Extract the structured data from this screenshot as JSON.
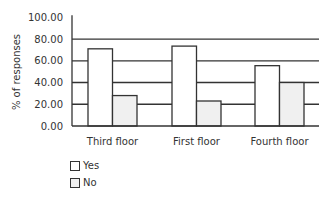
{
  "chart_data": {
    "type": "bar",
    "title": "",
    "xlabel": "",
    "ylabel": "% of responses",
    "ylim": [
      0,
      100
    ],
    "yticks": [
      "0.00",
      "20.00",
      "40.00",
      "60.00",
      "80.00",
      "100.00"
    ],
    "grid": true,
    "legend_position": "bottom-left",
    "categories": [
      "Third floor",
      "First floor",
      "Fourth floor"
    ],
    "series": [
      {
        "name": "Yes",
        "color": "#ffffff",
        "values": [
          71,
          73.5,
          55.5
        ]
      },
      {
        "name": "No",
        "color": "#f0f0f0",
        "values": [
          28,
          23,
          40
        ]
      }
    ]
  },
  "legend": {
    "items": [
      {
        "label": "Yes",
        "color": "#ffffff"
      },
      {
        "label": "No",
        "color": "#f0f0f0"
      }
    ]
  }
}
